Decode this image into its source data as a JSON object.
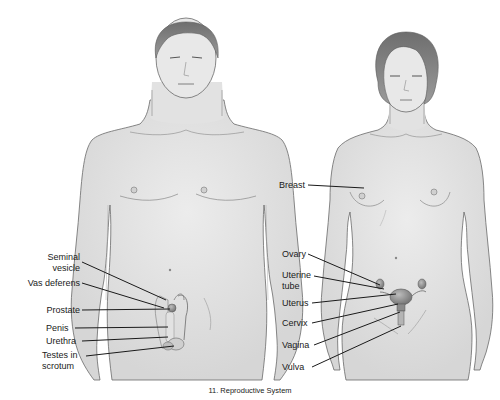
{
  "caption": "11. Reproductive System",
  "figures": {
    "male": {
      "name": "Male figure",
      "labels": [
        {
          "id": "seminal-vesicle",
          "text": "Seminal\nvesicle"
        },
        {
          "id": "vas-deferens",
          "text": "Vas deferens"
        },
        {
          "id": "prostate",
          "text": "Prostate"
        },
        {
          "id": "penis",
          "text": "Penis"
        },
        {
          "id": "urethra",
          "text": "Urethra"
        },
        {
          "id": "testes-in-scrotum",
          "text": "Testes in\nscrotum"
        }
      ]
    },
    "female": {
      "name": "Female figure",
      "labels": [
        {
          "id": "breast",
          "text": "Breast"
        },
        {
          "id": "ovary",
          "text": "Ovary"
        },
        {
          "id": "uterine-tube",
          "text": "Uterine\ntube"
        },
        {
          "id": "uterus",
          "text": "Uterus"
        },
        {
          "id": "cervix",
          "text": "Cervix"
        },
        {
          "id": "vagina",
          "text": "Vagina"
        },
        {
          "id": "vulva",
          "text": "Vulva"
        }
      ]
    }
  },
  "colors": {
    "skin": "#e6e6e6",
    "skin_shadow": "#d2d2d2",
    "outline": "#6a6a6a",
    "hair": "#7a7a7a",
    "organ": "#8c8c8c",
    "leader_line": "#1a1a1a"
  }
}
